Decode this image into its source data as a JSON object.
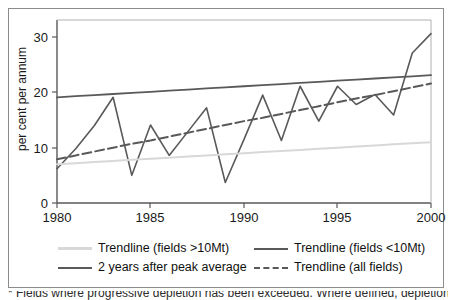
{
  "figure": {
    "caption_clipped": "* Fields where progressive depletion has been exceeded. Where defined, depletion is normalised as"
  },
  "chart_data": {
    "type": "line",
    "title": "",
    "xlabel": "",
    "ylabel": "per cent per annum",
    "xlim": [
      1980,
      2000
    ],
    "ylim": [
      0,
      32
    ],
    "xticks": [
      1980,
      1985,
      1990,
      1995,
      2000
    ],
    "yticks": [
      0,
      10,
      20,
      30
    ],
    "grid": false,
    "legend_position": "bottom",
    "x": [
      1980,
      1981,
      1982,
      1983,
      1984,
      1985,
      1986,
      1987,
      1988,
      1989,
      1990,
      1991,
      1992,
      1993,
      1994,
      1995,
      1996,
      1997,
      1998,
      1999,
      2000
    ],
    "series": [
      {
        "name": "2 years after peak average",
        "style": "solid",
        "color": "#595959",
        "width": 1.6,
        "values": [
          6.2,
          9.8,
          14.0,
          19.1,
          5.0,
          14.1,
          8.6,
          12.9,
          17.2,
          3.7,
          11.5,
          19.5,
          11.3,
          21.1,
          14.8,
          21.1,
          17.8,
          19.6,
          15.9,
          27.1,
          30.6
        ]
      },
      {
        "name": "Trendline (fields <10Mt)",
        "style": "solid",
        "color": "#595959",
        "width": 1.8,
        "values": [
          19.1,
          19.3,
          19.5,
          19.7,
          19.9,
          20.1,
          20.3,
          20.5,
          20.7,
          20.9,
          21.1,
          21.3,
          21.5,
          21.7,
          21.9,
          22.1,
          22.3,
          22.5,
          22.7,
          22.9,
          23.1
        ]
      },
      {
        "name": "Trendline (fields >10Mt)",
        "style": "solid",
        "color": "#d8d8d8",
        "width": 2.0,
        "values": [
          7.0,
          7.2,
          7.4,
          7.6,
          7.8,
          8.0,
          8.2,
          8.4,
          8.6,
          8.8,
          9.0,
          9.2,
          9.4,
          9.6,
          9.8,
          10.0,
          10.2,
          10.4,
          10.6,
          10.8,
          11.0
        ]
      },
      {
        "name": "Trendline (all fields)",
        "style": "dashed",
        "color": "#595959",
        "width": 2.0,
        "values": [
          7.9,
          8.6,
          9.3,
          10.0,
          10.7,
          11.3,
          12.0,
          12.7,
          13.4,
          14.1,
          14.8,
          15.4,
          16.1,
          16.8,
          17.5,
          18.2,
          18.9,
          19.5,
          20.2,
          20.9,
          21.6
        ]
      }
    ]
  },
  "axis": {
    "y_title": "per cent per annum",
    "y_tick_labels": [
      "0",
      "10",
      "20",
      "30"
    ],
    "x_tick_labels": [
      "1980",
      "1985",
      "1990",
      "1995",
      "2000"
    ]
  },
  "legend": {
    "items": [
      {
        "label": "Trendline (fields >10Mt)",
        "color": "#d8d8d8",
        "style": "solid"
      },
      {
        "label": "Trendline (fields <10Mt)",
        "color": "#595959",
        "style": "solid"
      },
      {
        "label": "2 years after peak average",
        "color": "#595959",
        "style": "solid"
      },
      {
        "label": "Trendline (all fields)",
        "color": "#595959",
        "style": "dashed"
      }
    ]
  },
  "colors": {
    "axis": "#595959",
    "frame": "#8c8c8c",
    "text": "#1a1a1a",
    "light_series": "#d8d8d8",
    "dark_series": "#595959"
  }
}
